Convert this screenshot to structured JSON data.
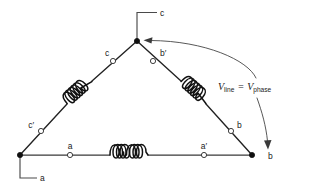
{
  "figure": {
    "type": "delta-connected-three-phase-winding-diagram",
    "background_color": "#ffffff",
    "line_color": "#3a3a3a",
    "coil_color": "#111111"
  },
  "labels": {
    "line_c": "c",
    "line_a": "a",
    "line_b": "b",
    "terminal_c": "c",
    "terminal_c_prime": "c′",
    "terminal_b_prime": "b′",
    "terminal_b": "b",
    "terminal_a": "a",
    "terminal_a_prime": "a′",
    "voltage_relation_v1": "V",
    "voltage_relation_sub1": "line",
    "voltage_relation_eq": "=",
    "voltage_relation_v2": "V",
    "voltage_relation_sub2": "phase",
    "voltage_relation_full": "V_line = V_phase"
  },
  "nodes": {
    "apex": {
      "label": "c",
      "x": 137,
      "y": 41,
      "type": "filled-junction"
    },
    "bottom_left": {
      "label": "a",
      "x": 20,
      "y": 155,
      "type": "filled-junction"
    },
    "bottom_right": {
      "label": "b",
      "x": 252,
      "y": 155,
      "type": "filled-junction"
    }
  },
  "terminals": [
    {
      "name": "c",
      "x": 113,
      "y": 61,
      "style": "open-circle"
    },
    {
      "name": "b′",
      "x": 153,
      "y": 61,
      "style": "open-circle"
    },
    {
      "name": "c′",
      "x": 41,
      "y": 131,
      "style": "open-circle"
    },
    {
      "name": "b",
      "x": 231,
      "y": 131,
      "style": "open-circle"
    },
    {
      "name": "a",
      "x": 70,
      "y": 155,
      "style": "open-circle"
    },
    {
      "name": "a′",
      "x": 204,
      "y": 155,
      "style": "open-circle"
    }
  ],
  "windings": [
    {
      "name": "phase-c-winding",
      "turns": 4,
      "side": "left-diagonal"
    },
    {
      "name": "phase-b-winding",
      "turns": 4,
      "side": "right-diagonal"
    },
    {
      "name": "phase-a-winding",
      "turns": 4,
      "side": "bottom-horizontal"
    }
  ],
  "annotations": {
    "curved_arrow_target": "apex-junction",
    "straight_arrow_target": "bottom-right-junction"
  }
}
